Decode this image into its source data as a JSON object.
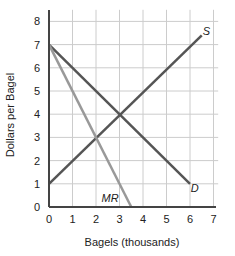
{
  "chart_data": {
    "type": "line",
    "title": "",
    "xlabel": "Bagels (thousands)",
    "ylabel": "Dollars per Bagel",
    "xlim": [
      0,
      7
    ],
    "ylim": [
      0,
      8
    ],
    "x_ticks": [
      "0",
      "1",
      "2",
      "3",
      "4",
      "5",
      "6",
      "7"
    ],
    "y_ticks": [
      "0",
      "1",
      "2",
      "3",
      "4",
      "5",
      "6",
      "7",
      "8"
    ],
    "grid": true,
    "series": [
      {
        "name": "S",
        "points": [
          [
            0,
            1
          ],
          [
            6.5,
            7.4
          ]
        ],
        "color": "#555555"
      },
      {
        "name": "D",
        "points": [
          [
            0,
            7
          ],
          [
            6,
            1
          ]
        ],
        "color": "#555555"
      },
      {
        "name": "MR",
        "points": [
          [
            0,
            7
          ],
          [
            3.5,
            0
          ]
        ],
        "color": "#999999"
      }
    ],
    "annotations": [
      {
        "text": "S",
        "x": 6.7,
        "y": 7.6
      },
      {
        "text": "D",
        "x": 6.2,
        "y": 0.8
      },
      {
        "text": "MR",
        "x": 2.6,
        "y": 0.4
      }
    ]
  }
}
